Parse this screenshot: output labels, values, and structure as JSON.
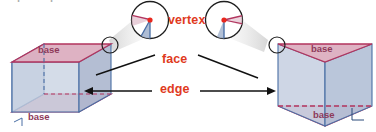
{
  "diagram": {
    "background": "#ffffff",
    "width": 376,
    "height": 132,
    "colors": {
      "label_red": "#e03a21",
      "label_base": "#8e3a5a",
      "base_face_fill": "#d8a6b8",
      "base_face_stroke": "#b2355e",
      "lateral_face_fill": "#bcc9de",
      "lateral_face_stroke": "#4a6fa5",
      "lateral_face_fill_dark": "#aab8d0",
      "leader_line": "#1a1a1a",
      "magnifier_stroke": "#1f1f1f",
      "magnifier_fill": "#ffffff",
      "vertex_dot": "#e8281e",
      "cone_fill": "#e3e3e3"
    },
    "callouts": [
      {
        "id": "vertex",
        "label": "vertex",
        "x": 168,
        "y": 15
      },
      {
        "id": "face",
        "label": "face",
        "x": 167,
        "y": 59
      },
      {
        "id": "edge",
        "label": "edge",
        "x": 166,
        "y": 88
      }
    ],
    "base_labels": [
      {
        "id": "left-top-base",
        "label": "base",
        "x": 48,
        "y": 45
      },
      {
        "id": "left-bottom-base",
        "label": "base",
        "x": 38,
        "y": 111
      },
      {
        "id": "right-top-base",
        "label": "base",
        "x": 316,
        "y": 44
      },
      {
        "id": "right-bottom-base",
        "label": "base",
        "x": 318,
        "y": 110
      }
    ],
    "shapes": [
      {
        "id": "left-prism",
        "kind": "rectangular-prism",
        "bases": 2,
        "faces": 6,
        "edges": 12,
        "vertices": 8
      },
      {
        "id": "right-prism",
        "kind": "triangular-prism",
        "bases": 2,
        "faces": 5,
        "edges": 9,
        "vertices": 6
      }
    ],
    "magnifiers": [
      {
        "id": "left-magnifier",
        "cx": 150,
        "cy": 20,
        "r": 19,
        "source_cx": 111,
        "source_cy": 45,
        "source_r": 8
      },
      {
        "id": "right-magnifier",
        "cx": 224,
        "cy": 20,
        "r": 19,
        "source_cx": 265,
        "source_cy": 45,
        "source_r": 8
      }
    ],
    "cropped_top_text": "• | • | •"
  }
}
